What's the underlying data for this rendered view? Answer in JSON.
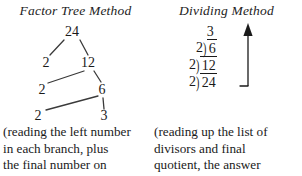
{
  "left": {
    "title": "Factor Tree Method",
    "tree": {
      "root": "24",
      "nodes": [
        {
          "label": "24",
          "x": 72,
          "y": 10
        },
        {
          "label": "2",
          "x": 46,
          "y": 41
        },
        {
          "label": "12",
          "x": 88,
          "y": 41
        },
        {
          "label": "2",
          "x": 42,
          "y": 68
        },
        {
          "label": "6",
          "x": 102,
          "y": 68
        },
        {
          "label": "2",
          "x": 38,
          "y": 94
        },
        {
          "label": "3",
          "x": 104,
          "y": 94
        }
      ],
      "edges": [
        {
          "x1": 64,
          "y1": 18,
          "x2": 50,
          "y2": 33
        },
        {
          "x1": 80,
          "y1": 18,
          "x2": 88,
          "y2": 33
        },
        {
          "x1": 84,
          "y1": 49,
          "x2": 48,
          "y2": 61
        },
        {
          "x1": 94,
          "y1": 49,
          "x2": 101,
          "y2": 60
        },
        {
          "x1": 98,
          "y1": 74,
          "x2": 46,
          "y2": 88
        },
        {
          "x1": 103,
          "y1": 76,
          "x2": 104,
          "y2": 87
        }
      ]
    },
    "caption": [
      "(reading the left number",
      "in each branch, plus",
      "the final number on"
    ]
  },
  "right": {
    "title": "Dividing Method",
    "division": {
      "quotient": "3",
      "bracket_glyph": ")",
      "rows": [
        {
          "divisor": "2",
          "dividend": "6"
        },
        {
          "divisor": "2",
          "dividend": "12"
        },
        {
          "divisor": "2",
          "dividend": "24"
        }
      ],
      "arrow_direction": "up"
    },
    "caption": [
      "(reading up the list of",
      "divisors and final",
      "quotient, the answer"
    ]
  },
  "colors": {
    "ink": "#1a1a1a",
    "background": "#ffffff"
  }
}
